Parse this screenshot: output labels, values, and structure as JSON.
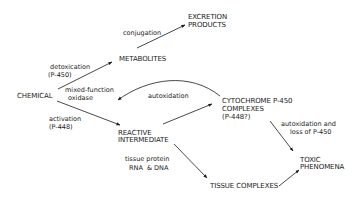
{
  "diagram": {
    "nodes": {
      "chemical": "CHEMICAL",
      "metabolites": "METABOLITES",
      "excretion_1": "EXCRETION",
      "excretion_2": "PRODUCTS",
      "reactive_1": "REACTIVE",
      "reactive_2": "INTERMEDIATE",
      "cytochrome_1": "CYTOCHROME P-450",
      "cytochrome_2": "COMPLEXES",
      "cytochrome_3": "(P-448?)",
      "toxic_1": "TOXIC",
      "toxic_2": "PHENOMENA",
      "tissue_complexes": "TISSUE COMPLEXES"
    },
    "edges": {
      "conjugation": "conjugation",
      "detox_1": "detoxication",
      "detox_2": "(P-450)",
      "mfo_1": "mixed-function",
      "mfo_2": "oxidase",
      "activation_1": "activation",
      "activation_2": "(P-448)",
      "autoxidation": "autoxidation",
      "autox_loss_1": "autoxidation and",
      "autox_loss_2": "loss of P-450",
      "tissue_protein": "tissue protein",
      "rna_dna": "RNA  & DNA"
    },
    "line_color": "#1a1a1a"
  }
}
